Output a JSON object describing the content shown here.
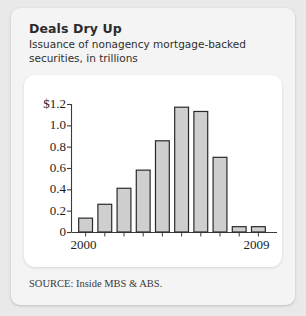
{
  "figure": {
    "title": "Deals Dry Up",
    "subtitle": "Issuance of nonagency mortgage-backed securities, in trillions",
    "source": "SOURCE: Inside MBS & ABS."
  },
  "colors": {
    "page_background": "#e9e9e9",
    "card_background": "#f4f4f4",
    "plot_background": "#ffffff",
    "bar_fill": "#cfcfcf",
    "bar_stroke": "#2a2a2a",
    "axis": "#3c3c3c",
    "title_text": "#2b2b2b",
    "tick_text": "#1c1c1c"
  },
  "chart_data": {
    "type": "bar",
    "title": "Deals Dry Up",
    "subtitle": "Issuance of nonagency mortgage-backed securities, in trillions",
    "xlabel": "",
    "ylabel": "",
    "categories": [
      "2000",
      "2001",
      "2002",
      "2003",
      "2004",
      "2005",
      "2006",
      "2007",
      "2008",
      "2009"
    ],
    "values": [
      0.13,
      0.26,
      0.41,
      0.58,
      0.855,
      1.17,
      1.13,
      0.7,
      0.05,
      0.05
    ],
    "ylim": [
      0,
      1.2
    ],
    "yticks": [
      0,
      0.2,
      0.4,
      0.6,
      0.8,
      1.0,
      1.2
    ],
    "ytick_labels": [
      "0",
      "0.2",
      "0.4",
      "0.6",
      "0.8",
      "1.0",
      "$1.2"
    ],
    "xtick_labels": [
      "2000",
      "2009"
    ],
    "xtick_label_indices": [
      0,
      9
    ],
    "grid": false,
    "legend": null,
    "units": "trillions of dollars",
    "source": "SOURCE: Inside MBS & ABS."
  }
}
